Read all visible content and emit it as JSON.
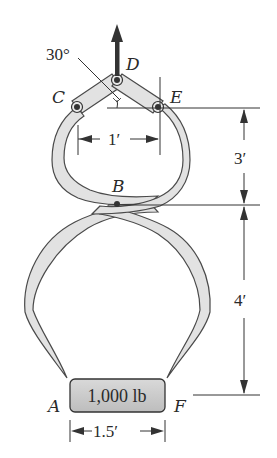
{
  "diagram": {
    "type": "tongs-mechanism",
    "colors": {
      "member_fill": "#e2e2e2",
      "outline": "#4a4a4a",
      "pin": "#333333",
      "box_fill": "#d6d6d6",
      "arrow": "#333333",
      "text": "#2a2a2a"
    },
    "points": {
      "A": "A",
      "B": "B",
      "C": "C",
      "D": "D",
      "E": "E",
      "F": "F"
    },
    "angle_label": "30°",
    "load_label": "1,000 lb",
    "dimensions": {
      "CE_width": "1′",
      "AF_width": "1.5′",
      "E_to_B": "3′",
      "B_to_AF": "4′"
    }
  }
}
